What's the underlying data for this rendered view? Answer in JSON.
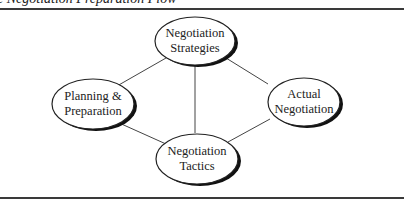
{
  "caption": "e Negotiation Preparation Flow",
  "nodes": [
    {
      "id": "strategies",
      "line1": "Negotiation",
      "line2": "Strategies",
      "cx": 195,
      "cy": 41
    },
    {
      "id": "planning",
      "line1": "Planning &",
      "line2": "Preparation",
      "cx": 93,
      "cy": 104
    },
    {
      "id": "actual",
      "line1": "Actual",
      "line2": "Negotiation",
      "cx": 304,
      "cy": 102
    },
    {
      "id": "tactics",
      "line1": "Negotiation",
      "line2": "Tactics",
      "cx": 197,
      "cy": 159
    }
  ],
  "edges": [
    {
      "from": "planning",
      "to": "strategies"
    },
    {
      "from": "planning",
      "to": "tactics"
    },
    {
      "from": "strategies",
      "to": "tactics"
    },
    {
      "from": "strategies",
      "to": "actual"
    },
    {
      "from": "tactics",
      "to": "actual"
    }
  ],
  "colors": {
    "stroke": "#222222",
    "shadow": "#000000",
    "rule": "#3a3a3a"
  }
}
